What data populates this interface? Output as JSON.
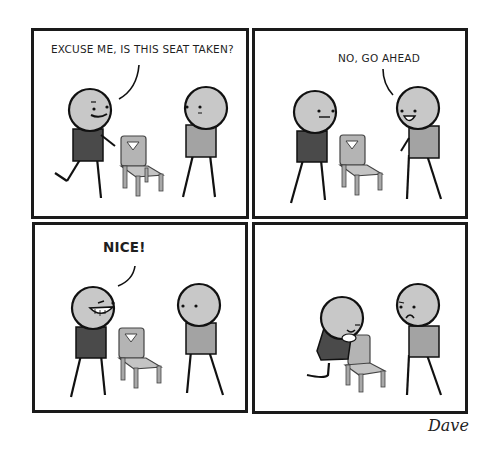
{
  "comic": {
    "colors": {
      "border": "#1a1a1a",
      "skin": "#c8c8c8",
      "dark_shirt": "#4a4a4a",
      "light_shirt": "#a3a3a3",
      "chair": "#b4b4b4",
      "line": "#111111"
    },
    "panels": [
      {
        "id": 1,
        "dialogue": "EXCUSE ME, IS THIS SEAT TAKEN?",
        "speaker": "left"
      },
      {
        "id": 2,
        "dialogue": "NO, GO AHEAD",
        "speaker": "right"
      },
      {
        "id": 3,
        "dialogue": "NICE!",
        "speaker": "left"
      },
      {
        "id": 4,
        "dialogue": "",
        "speaker": "none"
      }
    ],
    "signature": "Dave"
  }
}
